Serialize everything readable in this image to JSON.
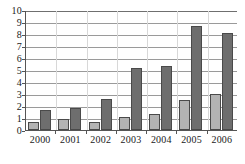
{
  "chart_data": {
    "type": "bar",
    "title": "",
    "xlabel": "",
    "ylabel": "",
    "categories": [
      "2000",
      "2001",
      "2002",
      "2003",
      "2004",
      "2005",
      "2006"
    ],
    "series": [
      {
        "name": "light-gray-series",
        "color": "#b3b3b3",
        "values": [
          0.7,
          0.95,
          0.65,
          1.05,
          1.3,
          2.5,
          3.0
        ]
      },
      {
        "name": "dark-gray-series",
        "color": "#6e6e6e",
        "values": [
          1.65,
          1.8,
          2.55,
          5.15,
          5.3,
          8.7,
          8.1
        ]
      }
    ],
    "ylim": [
      0,
      10
    ],
    "yticks": [
      "0",
      "1",
      "2",
      "3",
      "4",
      "5",
      "6",
      "7",
      "8",
      "9",
      "10"
    ],
    "grid": "horizontal",
    "legend": "none"
  },
  "axes": {
    "y_labels": [
      "10",
      "9",
      "8",
      "7",
      "6",
      "5",
      "4",
      "3",
      "2",
      "1",
      "0"
    ],
    "x_labels": [
      "2000",
      "2001",
      "2002",
      "2003",
      "2004",
      "2005",
      "2006"
    ]
  },
  "colors": {
    "series_light": "#b3b3b3",
    "series_dark": "#6e6e6e",
    "gridline": "#9a9a9a",
    "axis": "#555555",
    "background": "#ffffff"
  }
}
